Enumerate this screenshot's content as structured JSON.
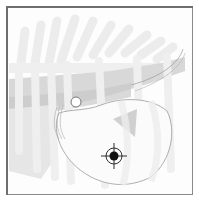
{
  "diagram": {
    "marker": {
      "type": "crosshair-target",
      "x": 113,
      "y": 155
    },
    "landmark": {
      "type": "small-circle",
      "x": 75,
      "y": 101
    },
    "colors": {
      "frame_border": "#8a8a8a",
      "background": "#fdfdfd",
      "rib_fill": "#ececec",
      "organ_fill": "#dcdcdc",
      "organ_dark": "#c8c8c8",
      "outline": "#9a9a9a",
      "marker": "#1a1a1a"
    }
  }
}
